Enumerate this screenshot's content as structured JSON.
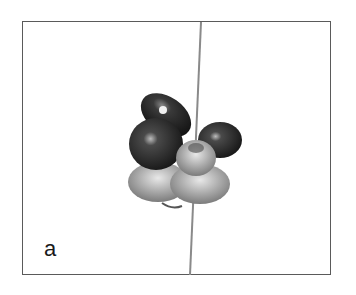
{
  "figure": {
    "panel_label": "a",
    "colors": {
      "frame": "#5a5a5a",
      "wire": "#8a8a8a",
      "dark_bead": "#1e1e1e",
      "silver_bead": "#9a9a9a",
      "background": "#ffffff"
    }
  }
}
